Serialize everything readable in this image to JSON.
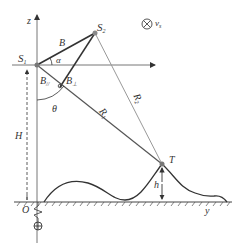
{
  "figure": {
    "type": "geometry-diagram"
  },
  "labels": {
    "z_axis": "z",
    "y_axis": "y",
    "origin": "O",
    "s1": "S",
    "s1_sub": "1",
    "s2": "S",
    "s2_sub": "2",
    "baseline": "B",
    "alpha": "α",
    "b_par": "B",
    "b_par_sub": "//",
    "b_perp": "B",
    "b_perp_sub": "⊥",
    "theta": "θ",
    "r1": "R",
    "r1_sub": "1",
    "r2": "R",
    "r2_sub": "2",
    "target": "T",
    "target_height": "h",
    "platform_height": "H",
    "velocity": "v",
    "velocity_sub": "s",
    "velocity_symbol": "⊗"
  },
  "colors": {
    "line_dark": "#333333",
    "line_gray": "#888888",
    "point": "#777777"
  }
}
